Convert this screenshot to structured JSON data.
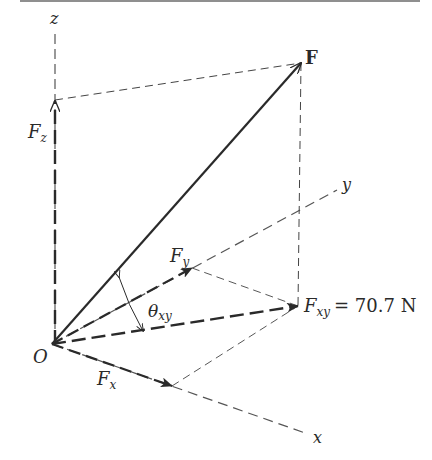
{
  "diagram": {
    "colors": {
      "ink": "#2a2a2a",
      "axis": "#555555",
      "topbar": "#8f8f8f"
    },
    "labels": {
      "z_axis": "z",
      "y_axis": "y",
      "x_axis": "x",
      "origin": "O",
      "force": "F",
      "fz_main": "F",
      "fz_sub": "z",
      "fy_main": "F",
      "fy_sub": "y",
      "fx_main": "F",
      "fx_sub": "x",
      "fxy_main": "F",
      "fxy_sub": "xy",
      "fxy_value": "= 70.7 N",
      "theta_main": "θ",
      "theta_sub": "xy"
    },
    "nodes": [
      {
        "id": "O",
        "x": 52,
        "y": 344
      },
      {
        "id": "F",
        "x": 301,
        "y": 63
      },
      {
        "id": "Fz",
        "x": 55,
        "y": 100
      },
      {
        "id": "Fxy",
        "x": 298,
        "y": 306
      },
      {
        "id": "Fy",
        "x": 192,
        "y": 268
      },
      {
        "id": "Fx",
        "x": 172,
        "y": 386
      }
    ],
    "edges": [
      {
        "from": "O",
        "to": "F",
        "style": "solid-arrow"
      },
      {
        "from": "O",
        "to": "Fz",
        "style": "dashed-arrow"
      },
      {
        "from": "O",
        "to": "Fxy",
        "style": "dashed-arrow"
      },
      {
        "from": "O",
        "to": "Fy",
        "style": "dashed-arrow"
      },
      {
        "from": "O",
        "to": "Fx",
        "style": "dashed-arrow"
      },
      {
        "from": "Fz",
        "to": "F",
        "style": "dashed"
      },
      {
        "from": "F",
        "to": "Fxy",
        "style": "dashed"
      },
      {
        "from": "Fy",
        "to": "Fxy",
        "style": "dashed"
      },
      {
        "from": "Fx",
        "to": "Fxy",
        "style": "dashed"
      }
    ]
  }
}
